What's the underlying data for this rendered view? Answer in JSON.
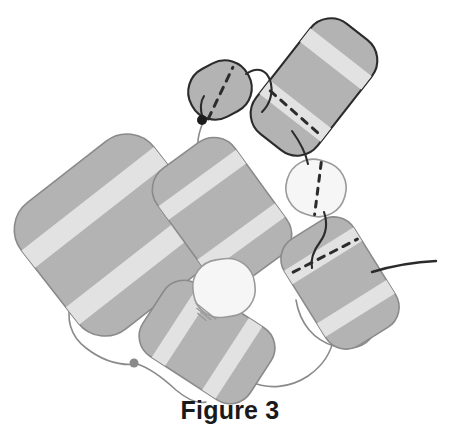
{
  "figure": {
    "caption": "Figure 3",
    "background_color": "#ffffff",
    "type": "schematic-diagram"
  },
  "palette": {
    "module_fill": "#b3b3b3",
    "module_stripe": "#e2e2e2",
    "module_outline_light": "#8a8a8a",
    "module_outline_dark": "#2b2b2b",
    "pale_module_fill": "#f6f6f6",
    "pale_module_outline": "#9a9a9a",
    "link_light": "#8a8a8a",
    "link_dark": "#2b2b2b",
    "dash_dark": "#2b2b2b",
    "dash_light": "#6f6f6f",
    "terminal_dark": "#1c1c1c",
    "terminal_light": "#8a8a8a"
  },
  "modules": [
    {
      "id": "module-large-left",
      "label": "large-left-module",
      "shape": "rounded-square",
      "cx": 116,
      "cy": 235,
      "width": 168,
      "height": 160,
      "corner_radius": 34,
      "rotation": -38,
      "fill": "#b3b3b3",
      "outline": "#8a8a8a",
      "outline_width": 1.6,
      "stripes": 2,
      "dashed_line": false
    },
    {
      "id": "module-upper-middle",
      "label": "upper-middle-module",
      "shape": "rounded-rect",
      "cx": 222,
      "cy": 212,
      "width": 96,
      "height": 140,
      "corner_radius": 26,
      "rotation": -36,
      "fill": "#b3b3b3",
      "outline": "#8a8a8a",
      "outline_width": 1.6,
      "stripes": 2,
      "dashed_line": false
    },
    {
      "id": "module-bottom-middle",
      "label": "bottom-middle-module",
      "shape": "rounded-rect",
      "cx": 207,
      "cy": 342,
      "width": 86,
      "height": 128,
      "corner_radius": 24,
      "rotation": -57,
      "fill": "#b3b3b3",
      "outline": "#8a8a8a",
      "outline_width": 1.6,
      "stripes": 2,
      "dashed_line": false
    },
    {
      "id": "module-right-lower",
      "label": "right-lower-module",
      "shape": "rounded-rect",
      "cx": 340,
      "cy": 283,
      "width": 82,
      "height": 126,
      "corner_radius": 24,
      "rotation": -32,
      "fill": "#b3b3b3",
      "outline": "#8a8a8a",
      "outline_width": 1.6,
      "stripes": 2,
      "dashed_line": true,
      "dash_color": "#2b2b2b"
    },
    {
      "id": "module-top-right-dark",
      "label": "top-right-outlined-module",
      "shape": "rounded-rect",
      "cx": 314,
      "cy": 87,
      "width": 78,
      "height": 140,
      "corner_radius": 26,
      "rotation": 38,
      "fill": "#b3b3b3",
      "outline": "#2b2b2b",
      "outline_width": 2.1,
      "stripes": 2,
      "dashed_line": true,
      "dash_color": "#2b2b2b"
    },
    {
      "id": "module-top-oval",
      "label": "top-small-oval-module",
      "shape": "rounded-oval",
      "cx": 220,
      "cy": 90,
      "width": 64,
      "height": 54,
      "corner_radius": 26,
      "rotation": -28,
      "fill": "#b3b3b3",
      "outline": "#2b2b2b",
      "outline_width": 2.1,
      "stripes": 0,
      "dashed_line": true,
      "dash_color": "#2b2b2b"
    },
    {
      "id": "module-pale-right",
      "label": "pale-right-module",
      "shape": "rounded-oval",
      "cx": 316,
      "cy": 188,
      "width": 60,
      "height": 56,
      "corner_radius": 27,
      "rotation": 16,
      "fill": "#f6f6f6",
      "outline": "#9a9a9a",
      "outline_width": 1.6,
      "stripes": 0,
      "dashed_line": true,
      "dash_color": "#2b2b2b"
    },
    {
      "id": "module-pale-center",
      "label": "pale-center-module",
      "shape": "rounded-oval",
      "cx": 224,
      "cy": 288,
      "width": 62,
      "height": 58,
      "corner_radius": 27,
      "rotation": -8,
      "fill": "#f6f6f6",
      "outline": "#9a9a9a",
      "outline_width": 1.6,
      "stripes": 0,
      "dashed_line": false,
      "hatch_lines": 3
    }
  ],
  "links": [
    {
      "id": "link-top-oval-to-dark",
      "color": "#2b2b2b",
      "width": 2.1
    },
    {
      "id": "link-dark-to-pale-right",
      "color": "#2b2b2b",
      "width": 2.1
    },
    {
      "id": "link-pale-right-to-right-lower",
      "color": "#2b2b2b",
      "width": 2.1
    },
    {
      "id": "link-right-lower-tail",
      "color": "#2b2b2b",
      "width": 2.4
    },
    {
      "id": "link-terminal-to-upper-middle",
      "color": "#8a8a8a",
      "width": 1.6
    },
    {
      "id": "link-upper-middle-to-large-left",
      "color": "#8a8a8a",
      "width": 1.6
    },
    {
      "id": "link-large-left-to-bottom",
      "color": "#8a8a8a",
      "width": 1.6
    },
    {
      "id": "link-bottom-to-right-lower",
      "color": "#8a8a8a",
      "width": 1.6
    },
    {
      "id": "link-pale-center-to-upper",
      "color": "#8a8a8a",
      "width": 1.6
    }
  ],
  "terminals": [
    {
      "id": "terminal-upper",
      "label": "upper-terminal-dot",
      "cx": 202,
      "cy": 120,
      "r": 5,
      "fill": "#1c1c1c"
    },
    {
      "id": "terminal-lower",
      "label": "lower-terminal-dot",
      "cx": 134,
      "cy": 363,
      "r": 4.5,
      "fill": "#8a8a8a"
    }
  ]
}
